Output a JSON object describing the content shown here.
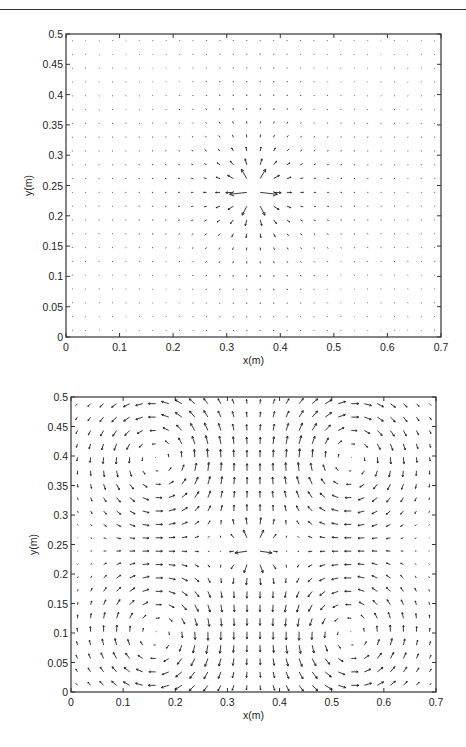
{
  "chart_data": [
    {
      "type": "quiver",
      "title": "",
      "xlabel": "x(m)",
      "ylabel": "y(m)",
      "xlim": [
        0,
        0.7
      ],
      "ylim": [
        0,
        0.5
      ],
      "xticks": [
        "0",
        "0.1",
        "0.2",
        "0.3",
        "0.4",
        "0.5",
        "0.6",
        "0.7"
      ],
      "yticks": [
        "0",
        "0.05",
        "0.1",
        "0.15",
        "0.2",
        "0.25",
        "0.3",
        "0.35",
        "0.4",
        "0.45",
        "0.5"
      ],
      "grid": false,
      "legend": null,
      "grid_points": {
        "nx": 28,
        "ny": 22
      },
      "field": {
        "description": "Radial outflow from a point source; velocity decays rapidly with distance",
        "source_center": [
          0.35,
          0.24
        ],
        "source_strength": 1.0,
        "vortices": []
      },
      "pixel_box": {
        "left": 66,
        "top": 34,
        "right": 441,
        "bottom": 337
      }
    },
    {
      "type": "quiver",
      "title": "",
      "xlabel": "x(m)",
      "ylabel": "y(m)",
      "xlim": [
        0,
        0.7
      ],
      "ylim": [
        0,
        0.5
      ],
      "xticks": [
        "0",
        "0.1",
        "0.2",
        "0.3",
        "0.4",
        "0.5",
        "0.6",
        "0.7"
      ],
      "yticks": [
        "0",
        "0.05",
        "0.1",
        "0.15",
        "0.2",
        "0.25",
        "0.3",
        "0.35",
        "0.4",
        "0.45",
        "0.5"
      ],
      "grid": false,
      "legend": null,
      "grid_points": {
        "nx": 28,
        "ny": 22
      },
      "field": {
        "description": "Radial outflow from a point source plus four recirculating vortices in the quadrants",
        "source_center": [
          0.35,
          0.24
        ],
        "source_strength": 1.0,
        "vortices": [
          {
            "center": [
              0.17,
              0.4
            ],
            "sense": "counterclockwise"
          },
          {
            "center": [
              0.53,
              0.4
            ],
            "sense": "clockwise"
          },
          {
            "center": [
              0.17,
              0.09
            ],
            "sense": "clockwise"
          },
          {
            "center": [
              0.53,
              0.09
            ],
            "sense": "counterclockwise"
          }
        ]
      },
      "pixel_box": {
        "left": 71,
        "top": 397,
        "right": 436,
        "bottom": 692
      }
    }
  ]
}
